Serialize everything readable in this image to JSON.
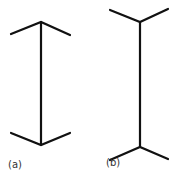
{
  "figures": [
    {
      "label": "(a)",
      "type": "arrowheads-inward"
    },
    {
      "label": "(b)",
      "type": "arrowheads-outward"
    }
  ],
  "colors": {
    "line": "#111111",
    "label": "#333333",
    "background": "#ffffff"
  }
}
